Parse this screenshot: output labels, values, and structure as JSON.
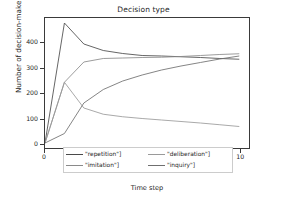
{
  "chart_data": {
    "type": "line",
    "title": "Decision type",
    "xlabel": "Time step",
    "ylabel": "Number of decision-makers",
    "xlim": [
      0,
      10.5
    ],
    "ylim": [
      -20,
      500
    ],
    "xticks": [
      0,
      2,
      4,
      6,
      8,
      10
    ],
    "yticks": [
      0,
      100,
      200,
      300,
      400
    ],
    "xtick_labels": [
      "0",
      "2",
      "4",
      "6",
      "8",
      "10"
    ],
    "ytick_labels": [
      "0",
      "100",
      "200",
      "300",
      "400"
    ],
    "grid": false,
    "legend_position": "lower center",
    "x": [
      0,
      1,
      2,
      3,
      4,
      5,
      6,
      7,
      8,
      9,
      10
    ],
    "series": [
      {
        "name": "\"repetition\"]",
        "color": "#4a4a4a",
        "values": [
          0,
          480,
          396,
          370,
          358,
          350,
          348,
          345,
          342,
          338,
          335
        ]
      },
      {
        "name": "\"imitation\"]",
        "color": "#8a8a8a",
        "values": [
          0,
          243,
          324,
          338,
          340,
          342,
          343,
          346,
          350,
          354,
          357
        ]
      },
      {
        "name": "\"deliberation\"]",
        "color": "#9a9a9a",
        "values": [
          0,
          243,
          140,
          115,
          105,
          98,
          92,
          86,
          80,
          73,
          66
        ]
      },
      {
        "name": "\"inquiry\"]",
        "color": "#6f6f6f",
        "values": [
          0,
          38,
          160,
          214,
          248,
          272,
          292,
          308,
          322,
          336,
          348
        ]
      }
    ]
  },
  "legend": {
    "entries": [
      {
        "label": "\"repetition\"]"
      },
      {
        "label": "\"deliberation\"]"
      },
      {
        "label": "\"imitation\"]"
      },
      {
        "label": "\"inquiry\"]"
      }
    ]
  }
}
